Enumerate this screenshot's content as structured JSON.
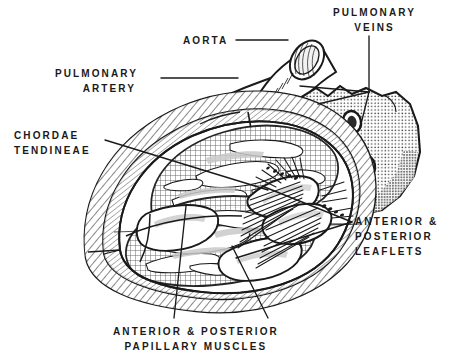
{
  "figure": {
    "background_color": "#ffffff",
    "ink_color": "#1a1a1a",
    "width": 470,
    "height": 357
  },
  "labels": {
    "aorta": {
      "line1": "AORTA"
    },
    "pulmonary_veins": {
      "line1": "PULMONARY",
      "line2": "VEINS"
    },
    "pulmonary_artery": {
      "line1": "PULMONARY",
      "line2": "ARTERY"
    },
    "chordae_tendineae": {
      "line1": "CHORDAE",
      "line2": "TENDINEAE"
    },
    "leaflets": {
      "line1": "ANTERIOR &",
      "line2": "POSTERIOR",
      "line3": "LEAFLETS"
    },
    "papillary_muscles": {
      "line1": "ANTERIOR & POSTERIOR",
      "line2": "PAPILLARY  MUSCLES"
    }
  },
  "structures": [
    {
      "name": "aorta",
      "description": "cut aortic tube with elliptical lumen, upper right"
    },
    {
      "name": "pulmonary-artery",
      "description": "tapering vessel running up-right behind aorta"
    },
    {
      "name": "pulmonary-veins",
      "description": "three oval venous openings in posterior atrial wall"
    },
    {
      "name": "atrial-wall",
      "description": "stippled cut wall of the left atrium, right side"
    },
    {
      "name": "ventricular-wall",
      "description": "hatched cross-sectioned myocardium forming outer shell"
    },
    {
      "name": "anterior-leaflet",
      "description": "mitral valve anterior cusp"
    },
    {
      "name": "posterior-leaflet",
      "description": "mitral valve posterior cusp"
    },
    {
      "name": "chordae-tendineae",
      "description": "fine radiating tendinous cords from leaflets to papillary muscles"
    },
    {
      "name": "anterior-papillary-muscle",
      "description": "trabeculated muscle pillar, lower left"
    },
    {
      "name": "posterior-papillary-muscle",
      "description": "trabeculated muscle pillar, lower center"
    },
    {
      "name": "endocardium",
      "description": "inner chamber surface with trabeculae carneae texture"
    }
  ]
}
